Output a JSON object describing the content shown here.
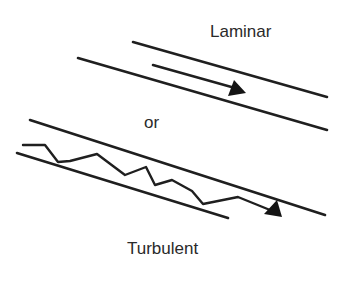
{
  "diagram": {
    "labels": {
      "laminar": "Laminar",
      "separator": "or",
      "turbulent": "Turbulent"
    },
    "panels": [
      {
        "name": "laminar",
        "description": "Two parallel diagonal walls with a straight flow arrow between them",
        "flow_path": "straight",
        "arrow": "filled-triangle"
      },
      {
        "name": "turbulent",
        "description": "Two parallel diagonal walls with a jagged, zig-zag flow arrow between them",
        "flow_path": "irregular",
        "arrow": "filled-triangle"
      }
    ],
    "colors": {
      "ink": "#1f1f1f",
      "text": "#2a2a2a",
      "background": "#ffffff"
    }
  }
}
